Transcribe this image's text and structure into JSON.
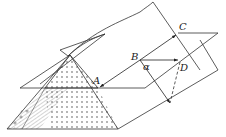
{
  "diagram": {
    "type": "geometry-ridge-plane",
    "labels": {
      "A": "A",
      "B": "B",
      "C": "C",
      "D": "D",
      "alpha": "α"
    },
    "colors": {
      "stroke": "#333333",
      "background": "#ffffff"
    }
  }
}
